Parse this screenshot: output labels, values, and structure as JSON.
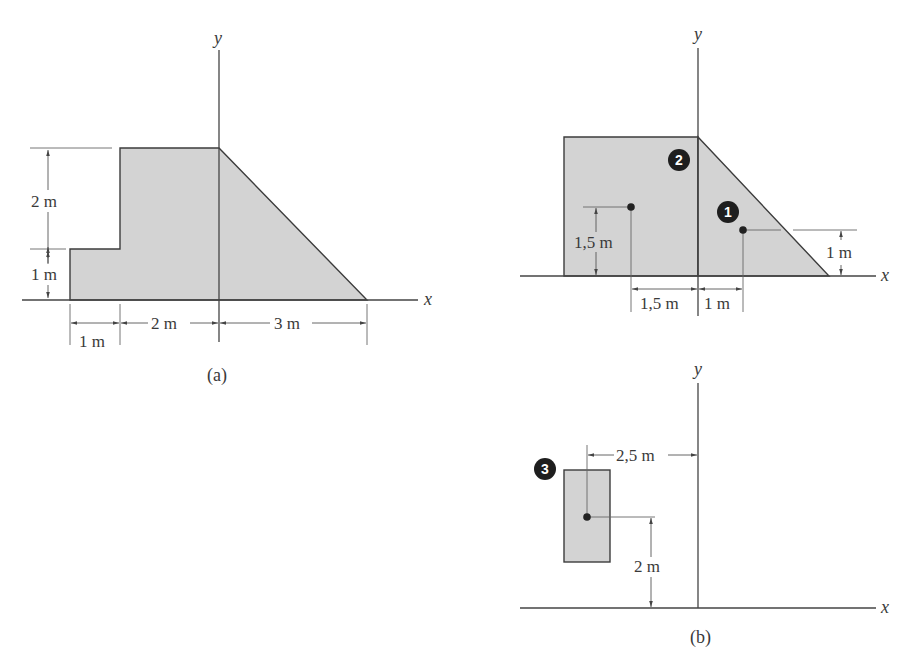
{
  "figure_a": {
    "caption": "(a)",
    "axis_labels": {
      "x": "x",
      "y": "y"
    },
    "dimensions": {
      "height_upper": "2 m",
      "height_lower": "1 m",
      "width_left": "1 m",
      "width_middle": "2 m",
      "width_right": "3 m"
    }
  },
  "figure_b": {
    "caption": "(b)",
    "axis_labels": {
      "x": "x",
      "y": "y"
    },
    "parts": [
      {
        "id": "1",
        "label": "1",
        "shape": "triangle",
        "centroid_x_label": "1 m",
        "centroid_y_label": "1 m"
      },
      {
        "id": "2",
        "label": "2",
        "shape": "rectangle",
        "centroid_x_label": "1,5 m",
        "centroid_y_label": "1,5 m"
      },
      {
        "id": "3",
        "label": "3",
        "shape": "rectangle (hole)",
        "centroid_x_label": "2,5 m",
        "centroid_y_label": "2 m"
      }
    ]
  },
  "colors": {
    "fill": "#d3d3d3",
    "stroke": "#3c3c3c",
    "badge": "#1e1e1e"
  }
}
